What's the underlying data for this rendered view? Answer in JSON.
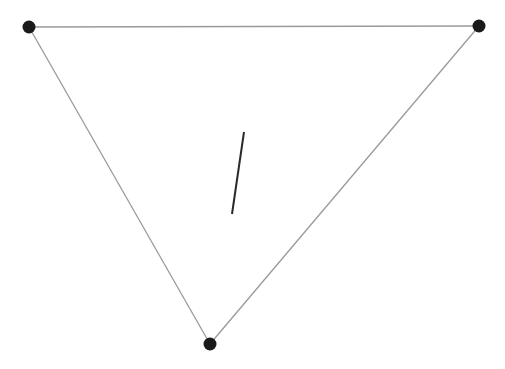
{
  "diagram": {
    "width": 505,
    "height": 369,
    "background": "#ffffff",
    "edge_color": "#9a9a9a",
    "vertex_color": "#1a1a1a",
    "segment_color": "#2a2a2a",
    "vertices": [
      {
        "id": "top-left",
        "x": 29,
        "y": 27,
        "r": 6.5
      },
      {
        "id": "top-right",
        "x": 479,
        "y": 26,
        "r": 6.5
      },
      {
        "id": "bottom",
        "x": 210,
        "y": 344,
        "r": 6.5
      }
    ],
    "edges": [
      {
        "from": "top-left",
        "to": "top-right"
      },
      {
        "from": "top-right",
        "to": "bottom"
      },
      {
        "from": "bottom",
        "to": "top-left"
      }
    ],
    "inner_segment": {
      "x1": 244,
      "y1": 132,
      "x2": 232,
      "y2": 214
    }
  }
}
